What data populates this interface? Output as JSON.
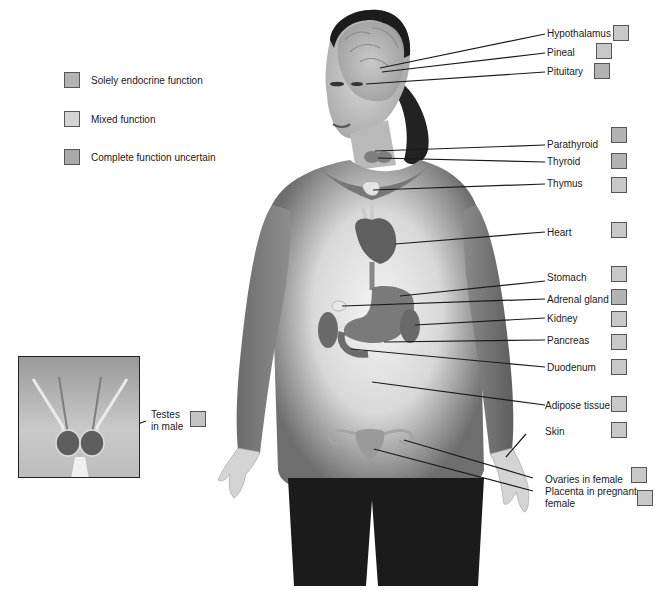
{
  "legend": {
    "items": [
      {
        "label": "Solely endocrine function",
        "type": "solely",
        "color": "#b3b3b3"
      },
      {
        "label": "Mixed function",
        "type": "mixed",
        "color": "#d3d3d3"
      },
      {
        "label": "Complete function uncertain",
        "type": "uncertain",
        "color": "#a9a9a9"
      }
    ]
  },
  "labels": {
    "hypothalamus": "Hypothalamus",
    "pineal": "Pineal",
    "pituitary": "Pituitary",
    "parathyroid": "Parathyroid",
    "thyroid": "Thyroid",
    "thymus": "Thymus",
    "heart": "Heart",
    "stomach": "Stomach",
    "adrenal": "Adrenal gland",
    "kidney": "Kidney",
    "pancreas": "Pancreas",
    "duodenum": "Duodenum",
    "adipose": "Adipose tissue",
    "skin": "Skin",
    "ovaries": "Ovaries in female",
    "placenta_1": "Placenta in pregnant",
    "placenta_2": "female",
    "testes_1": "Testes",
    "testes_2": "in male"
  }
}
